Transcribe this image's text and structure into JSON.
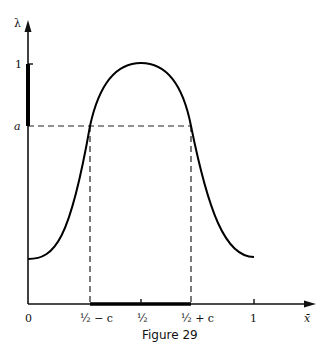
{
  "figure": {
    "caption": "Figure 29",
    "y_axis_label": "λ",
    "x_axis_label": "x̄",
    "y_ticks": [
      {
        "label": "1",
        "value": 1
      },
      {
        "label": "a",
        "value": "a"
      }
    ],
    "x_ticks": [
      {
        "label": "0",
        "value": 0
      },
      {
        "label": "½ − c",
        "value": "1/2 - c"
      },
      {
        "label": "½",
        "value": 0.5
      },
      {
        "label": "½ + c",
        "value": "1/2 + c"
      },
      {
        "label": "1",
        "value": 1
      }
    ],
    "curve": "bell-shaped curve λ(x̄) with maximum 1 at x̄ = ½, crossing level a at x̄ = ½ ± c",
    "highlighted_y_interval": "[a, 1] (bold segment on λ axis)",
    "highlighted_x_interval": "[½ − c, ½ + c] (bold segment on x̄ axis)"
  }
}
